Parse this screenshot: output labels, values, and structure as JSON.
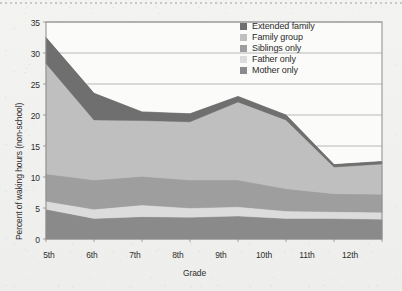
{
  "chart_data": {
    "type": "area",
    "stacked": true,
    "title": "",
    "xlabel": "Grade",
    "ylabel": "Percent of waking hours (non-school)",
    "categories": [
      "5th",
      "6th",
      "7th",
      "8th",
      "9th",
      "10th",
      "11th",
      "12th"
    ],
    "x_tick_labels": [
      "5th",
      "6th",
      "7th",
      "8th",
      "9th",
      "10th",
      "11th",
      "12th"
    ],
    "y_tick_labels": [
      "0",
      "5",
      "10",
      "15",
      "20",
      "25",
      "30",
      "35"
    ],
    "y_ticks": [
      0,
      5,
      10,
      15,
      20,
      25,
      30,
      35
    ],
    "ylim": [
      0,
      35
    ],
    "grid": "horizontal",
    "legend_position": "top-right",
    "series": [
      {
        "name": "Mother only",
        "color": "#8a8a8a",
        "values": [
          4.8,
          3.3,
          3.6,
          3.5,
          3.7,
          3.3,
          3.3,
          3.2
        ]
      },
      {
        "name": "Father only",
        "color": "#dcdcdc",
        "values": [
          1.3,
          1.5,
          1.9,
          1.5,
          1.5,
          1.2,
          1.1,
          1.1
        ]
      },
      {
        "name": "Siblings only",
        "color": "#9e9e9e",
        "values": [
          4.4,
          4.7,
          4.6,
          4.5,
          4.3,
          3.6,
          2.9,
          2.9
        ]
      },
      {
        "name": "Family group",
        "color": "#bfbfbf",
        "values": [
          17.8,
          9.7,
          9.0,
          9.4,
          12.6,
          11.1,
          4.3,
          4.9
        ]
      },
      {
        "name": "Extended family",
        "color": "#6f6f6f",
        "values": [
          4.2,
          4.3,
          1.4,
          1.3,
          0.9,
          0.8,
          0.4,
          0.4
        ]
      }
    ],
    "totals": [
      32.5,
      23.5,
      20.5,
      20.2,
      23.0,
      20.0,
      12.0,
      12.5
    ]
  },
  "legend": {
    "items": [
      {
        "label": "Extended family",
        "color": "#6f6f6f"
      },
      {
        "label": "Family group",
        "color": "#bfbfbf"
      },
      {
        "label": "Siblings only",
        "color": "#9e9e9e"
      },
      {
        "label": "Father only",
        "color": "#dcdcdc"
      },
      {
        "label": "Mother only",
        "color": "#8a8a8a"
      }
    ]
  },
  "axes": {
    "y_title": "Percent of waking hours (non-school)",
    "x_title": "Grade"
  },
  "colors": {
    "plot_border": "#8c8c8c",
    "gridline": "#8c8c8c",
    "text": "#2e2e2e",
    "background": "#f2f2f0"
  }
}
